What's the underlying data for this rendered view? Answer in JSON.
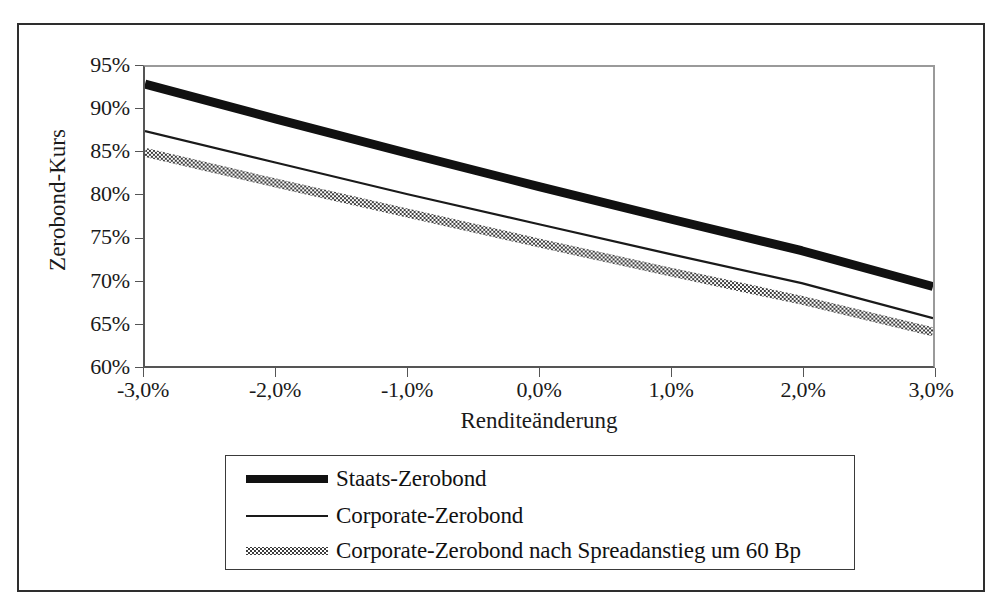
{
  "chart_data": {
    "type": "line",
    "title": "",
    "xlabel": "Renditeänderung",
    "ylabel": "Zerobond-Kurs",
    "xlim": [
      -3.0,
      3.0
    ],
    "ylim": [
      60,
      95
    ],
    "grid": false,
    "legend_position": "bottom",
    "x_tick_labels": [
      "-3,0%",
      "-2,0%",
      "-1,0%",
      "0,0%",
      "1,0%",
      "2,0%",
      "3,0%"
    ],
    "x_ticks": [
      -3.0,
      -2.0,
      -1.0,
      0.0,
      1.0,
      2.0,
      3.0
    ],
    "y_tick_labels": [
      "95%",
      "90%",
      "85%",
      "80%",
      "75%",
      "70%",
      "65%",
      "60%"
    ],
    "y_ticks": [
      95,
      90,
      85,
      80,
      75,
      70,
      65,
      60
    ],
    "x": [
      -3.0,
      -2.0,
      -1.0,
      0.0,
      1.0,
      2.0,
      3.0
    ],
    "series": [
      {
        "name": "Staats-Zerobond",
        "style": "thick-solid",
        "color": "#111111",
        "values": [
          93.0,
          88.9,
          84.9,
          81.0,
          77.2,
          73.5,
          69.3
        ]
      },
      {
        "name": "Corporate-Zerobond",
        "style": "thin-solid",
        "color": "#1a1a1a",
        "values": [
          87.5,
          83.8,
          80.1,
          76.6,
          73.1,
          69.7,
          65.6
        ]
      },
      {
        "name": "Corporate-Zerobond nach Spreadanstieg um 60 Bp",
        "style": "checkered",
        "color": "#4a4a4a",
        "values": [
          85.0,
          81.4,
          77.9,
          74.4,
          71.0,
          67.7,
          64.0
        ]
      }
    ]
  },
  "axes": {
    "y_title": "Zerobond-Kurs",
    "x_title": "Renditeänderung",
    "y_labels": [
      "95%",
      "90%",
      "85%",
      "80%",
      "75%",
      "70%",
      "65%",
      "60%"
    ],
    "x_labels": [
      "-3,0%",
      "-2,0%",
      "-1,0%",
      "0,0%",
      "1,0%",
      "2,0%",
      "3,0%"
    ]
  },
  "legend": {
    "entries": [
      {
        "label": "Staats-Zerobond",
        "swatch": "thick-line-swatch"
      },
      {
        "label": "Corporate-Zerobond",
        "swatch": "thin-line-swatch"
      },
      {
        "label": "Corporate-Zerobond nach Spreadanstieg um 60 Bp",
        "swatch": "checkered-line-swatch"
      }
    ]
  }
}
